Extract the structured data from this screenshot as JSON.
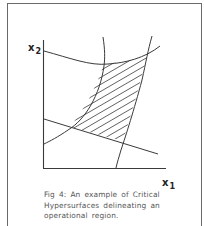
{
  "figure": {
    "number_label": "Fig 4:",
    "caption_lines": [
      "Fig 4:  An example  of  Critical",
      "Hypersurfaces  delineating  an",
      "operational  region."
    ],
    "caption_full": "Fig 4: An example of Critical Hypersurfaces delineating an operational region.",
    "axes": {
      "y_label": {
        "main": "x",
        "sub": "2"
      },
      "x_label": {
        "main": "x",
        "sub": "1"
      }
    },
    "elements": {
      "top_hypersurface": "curved boundary crossing upper part of plot",
      "left_hypersurface": "curved boundary from top descending to left axis",
      "right_hypersurface": "near-vertical curved boundary from top to x-axis",
      "straight_hypersurface": "straight line descending from y-axis to right",
      "operational_region": "hatched region bounded by the four hypersurfaces"
    },
    "colors": {
      "line": "#3a3a3a",
      "frame": "#6a6a6a",
      "caption_text": "#555555",
      "background": "#ffffff"
    }
  }
}
